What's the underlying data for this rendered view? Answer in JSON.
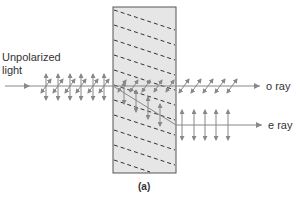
{
  "diagram": {
    "caption": "(a)",
    "incident_label_line1": "Unpolarized",
    "incident_label_line2": "light",
    "o_ray_label": "o ray",
    "e_ray_label": "e ray",
    "colors": {
      "crystal_fill": "#e6e6e6",
      "crystal_stroke": "#555555",
      "ray": "#888888",
      "text": "#333333"
    }
  }
}
